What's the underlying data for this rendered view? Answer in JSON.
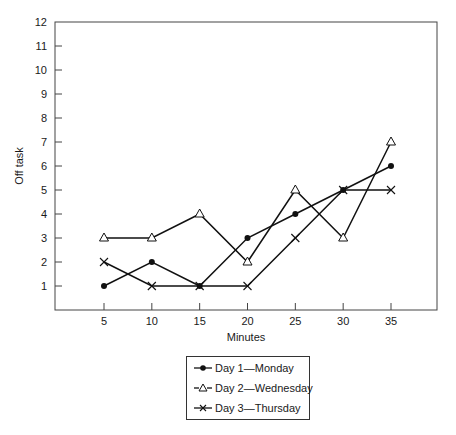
{
  "chart_data": {
    "type": "line",
    "title": "",
    "xlabel": "Minutes",
    "ylabel": "Off task",
    "x": [
      5,
      10,
      15,
      20,
      25,
      30,
      35
    ],
    "x_ticks": [
      "5",
      "10",
      "15",
      "20",
      "25",
      "30",
      "35"
    ],
    "y_ticks": [
      "1",
      "2",
      "3",
      "4",
      "5",
      "6",
      "7",
      "8",
      "9",
      "10",
      "11",
      "12"
    ],
    "xlim": [
      0,
      40
    ],
    "ylim": [
      0,
      12
    ],
    "grid": false,
    "legend_position": "bottom-center",
    "series": [
      {
        "name": "Day 1—Monday",
        "marker": "filled-circle",
        "values": [
          1,
          2,
          1,
          3,
          4,
          5,
          6
        ]
      },
      {
        "name": "Day 2—Wednesday",
        "marker": "open-triangle",
        "values": [
          3,
          3,
          4,
          2,
          5,
          3,
          7
        ]
      },
      {
        "name": "Day 3—Thursday",
        "marker": "x",
        "values": [
          2,
          1,
          1,
          1,
          3,
          5,
          5
        ]
      }
    ]
  },
  "legend": {
    "items": [
      "Day 1—Monday",
      "Day 2—Wednesday",
      "Day 3—Thursday"
    ]
  },
  "axes": {
    "xlabel": "Minutes",
    "ylabel": "Off task"
  }
}
